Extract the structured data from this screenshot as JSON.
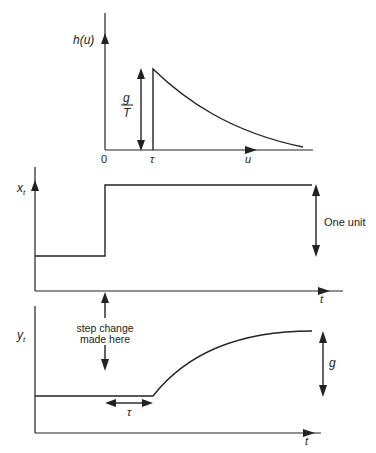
{
  "panels": {
    "impulse_response": {
      "y_label": "h(u)",
      "x_label": "u",
      "origin_label": "0",
      "delay_label": "τ",
      "height_label_numerator": "g",
      "height_label_denominator": "T"
    },
    "input": {
      "y_label": "x",
      "y_label_sub": "t",
      "x_label": "t",
      "step_size_label": "One unit"
    },
    "output": {
      "y_label": "y",
      "y_label_sub": "t",
      "x_label": "t",
      "step_annotation_line1": "step change",
      "step_annotation_line2": "made here",
      "delay_label": "τ",
      "gain_label": "g"
    }
  },
  "colors": {
    "ink": "#222222",
    "background": "#ffffff"
  }
}
